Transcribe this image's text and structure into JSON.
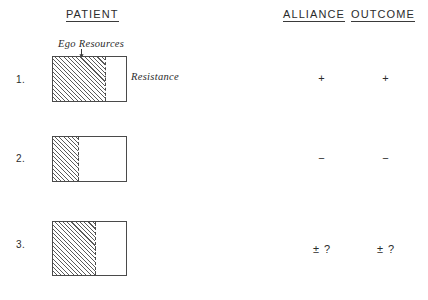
{
  "headers": {
    "patient": "PATIENT",
    "alliance": "ALLIANCE",
    "outcome": "OUTCOME"
  },
  "annotations": {
    "ego_resources": "Ego Resources",
    "resistance": "Resistance",
    "arrow_icon": "down-arrow-icon"
  },
  "rows": [
    {
      "number": "1.",
      "alliance": "+",
      "outcome": "+"
    },
    {
      "number": "2.",
      "alliance": "−",
      "outcome": "−"
    },
    {
      "number": "3.",
      "alliance": "± ?",
      "outcome": "± ?"
    }
  ],
  "chart_data": {
    "type": "bar",
    "orientation": "horizontal-stacked",
    "categories": [
      "1.",
      "2.",
      "3."
    ],
    "series": [
      {
        "name": "Ego Resources",
        "values": [
          72,
          35,
          59
        ],
        "unit": "percent-of-bar",
        "fill": "diagonal-hatch"
      },
      {
        "name": "Resistance",
        "values": [
          28,
          65,
          41
        ],
        "unit": "percent-of-bar",
        "fill": "white"
      }
    ],
    "annotations": [
      "Ego Resources",
      "Resistance"
    ],
    "columns": [
      "PATIENT",
      "ALLIANCE",
      "OUTCOME"
    ],
    "alliance": [
      "+",
      "−",
      "± ?"
    ],
    "outcome": [
      "+",
      "−",
      "± ?"
    ],
    "xlabel": "",
    "ylabel": "",
    "grid": false,
    "legend": "none"
  },
  "colors": {
    "ink": "#2b2b2b",
    "line": "#4a4a4a",
    "hatch": "#5a5a5a",
    "background": "#ffffff"
  }
}
